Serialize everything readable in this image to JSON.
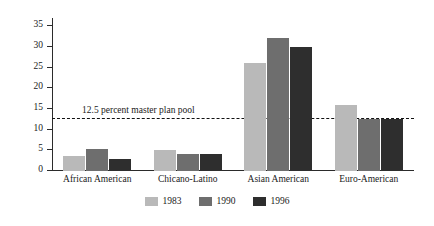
{
  "chart_data": {
    "type": "bar",
    "title": "",
    "xlabel": "",
    "ylabel": "Percent",
    "ylim": [
      0,
      37
    ],
    "yticks": [
      0,
      5,
      10,
      15,
      20,
      25,
      30,
      35
    ],
    "ytick_labels": [
      "0",
      "5",
      "10",
      "15",
      "20",
      "25",
      "30",
      "35"
    ],
    "grid": false,
    "legend_position": "bottom-center",
    "categories": [
      "African American",
      "Chicano-Latino",
      "Asian American",
      "Euro-American"
    ],
    "series": [
      {
        "name": "1983",
        "color": "#b9b9b9",
        "values": [
          3.7,
          5.0,
          26.2,
          16.0
        ]
      },
      {
        "name": "1990",
        "color": "#6e6e6e",
        "values": [
          5.4,
          4.2,
          32.2,
          12.5
        ]
      },
      {
        "name": "1996",
        "color": "#2e2e2e",
        "values": [
          2.8,
          4.2,
          30.1,
          12.5
        ]
      }
    ],
    "annotations": [
      {
        "name": "master-plan-threshold",
        "text": "12.5 percent master plan pool",
        "value": 12.5,
        "style": "dashed",
        "color": "#111111"
      }
    ]
  },
  "legend": {
    "items": [
      {
        "label": "1983",
        "color": "#b9b9b9"
      },
      {
        "label": "1990",
        "color": "#6e6e6e"
      },
      {
        "label": "1996",
        "color": "#2e2e2e"
      }
    ]
  }
}
